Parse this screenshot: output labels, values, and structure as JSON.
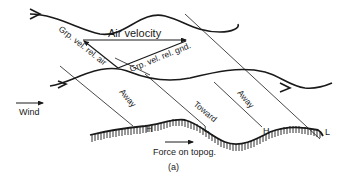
{
  "figure": {
    "panel_label": "(a)"
  },
  "labels": {
    "air_velocity": "Air velocity",
    "grp_vel_rel_air": "Grp. vel. rel. air",
    "grp_vel_rel_gnd": "Grp. vel. rel. gnd.",
    "wind": "Wind",
    "away_1": "Away",
    "toward": "Toward",
    "away_2": "Away",
    "force_on_topog": "Force on topog.",
    "h1": "H",
    "l1": "L",
    "h2": "H",
    "l2": "L"
  },
  "colors": {
    "ink": "#1a1a1a",
    "background": "#ffffff"
  }
}
